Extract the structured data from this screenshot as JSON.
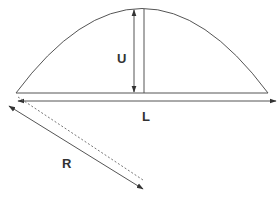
{
  "diagram": {
    "labels": {
      "height": "U",
      "length": "L",
      "radius": "R"
    },
    "colors": {
      "stroke": "#555555",
      "text": "#333333",
      "background": "#ffffff"
    }
  }
}
